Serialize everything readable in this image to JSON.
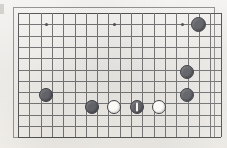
{
  "figure": {
    "kind": "go-board-diagram",
    "title": "",
    "caption": "",
    "background_color": "#f4f2ee",
    "line_color": "#6f6f70",
    "edge_color": "#4e4e50",
    "frame_color": "#8d8d8d",
    "black_stone_color": "#5f6066",
    "white_stone_color": "#fbfaf7",
    "stone_outline_color": "#3b3c42",
    "move_mark_color": "#f6f5f2"
  },
  "board": {
    "origin_x": 18,
    "origin_y": 13,
    "cell": 11.3,
    "cols": 18,
    "rows": 11,
    "frame": {
      "x": 13,
      "y": 7,
      "width": 202,
      "height": 131
    },
    "star_points": [
      {
        "col": 2.5,
        "row": 1
      },
      {
        "col": 8.5,
        "row": 1
      },
      {
        "col": 14.5,
        "row": 1
      },
      {
        "col": 15.9,
        "row": 1
      },
      {
        "col": 10.5,
        "row": 8
      }
    ]
  },
  "stones": [
    {
      "id": "b1",
      "color": "black",
      "x": 198,
      "y": 24,
      "radius": 7.5,
      "marked": false
    },
    {
      "id": "b2",
      "color": "black",
      "x": 187,
      "y": 72,
      "radius": 7.0,
      "marked": false
    },
    {
      "id": "b3",
      "color": "black",
      "x": 187,
      "y": 95,
      "radius": 7.0,
      "marked": false
    },
    {
      "id": "b4",
      "color": "black",
      "x": 46,
      "y": 95,
      "radius": 7.0,
      "marked": false
    },
    {
      "id": "b5",
      "color": "black",
      "x": 92,
      "y": 107,
      "radius": 7.0,
      "marked": false
    },
    {
      "id": "b6",
      "color": "black",
      "x": 137,
      "y": 107,
      "radius": 7.0,
      "marked": true
    },
    {
      "id": "w1",
      "color": "white",
      "x": 114,
      "y": 107,
      "radius": 7.0,
      "marked": false
    },
    {
      "id": "w2",
      "color": "white",
      "x": 159,
      "y": 107,
      "radius": 7.0,
      "marked": false
    }
  ],
  "legend": {
    "black_label": "Black stone",
    "white_label": "White stone",
    "marked_label": "Last move"
  }
}
